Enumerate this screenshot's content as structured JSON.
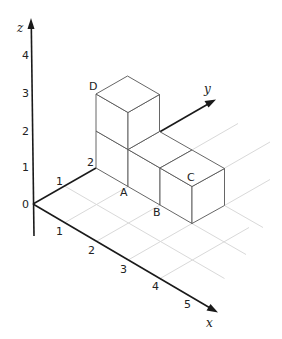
{
  "diagram": {
    "title": "",
    "axes": {
      "x": {
        "label": "x",
        "ticks": [
          "1",
          "2",
          "3",
          "4",
          "5"
        ]
      },
      "y": {
        "label": "y",
        "ticks": [
          "1",
          "2"
        ]
      },
      "z": {
        "label": "z",
        "ticks": [
          "1",
          "2",
          "3",
          "4"
        ]
      },
      "origin_label": "0"
    },
    "points": {
      "A": {
        "label": "A",
        "coords": [
          1,
          2,
          0
        ]
      },
      "B": {
        "label": "B",
        "coords": [
          2,
          2,
          0
        ]
      },
      "C": {
        "label": "C",
        "coords": [
          3,
          2,
          1
        ]
      },
      "D": {
        "label": "D",
        "coords": [
          0,
          2,
          2
        ]
      }
    },
    "cubes": [
      {
        "x": 0,
        "y": 2,
        "z": 0
      },
      {
        "x": 0,
        "y": 2,
        "z": 1
      },
      {
        "x": 1,
        "y": 2,
        "z": 0
      },
      {
        "x": 2,
        "y": 2,
        "z": 0
      }
    ],
    "colors": {
      "axis": "#1a1a1a",
      "cube_edge": "#555555",
      "grid": "#d9d9d9",
      "background": "#ffffff"
    }
  }
}
